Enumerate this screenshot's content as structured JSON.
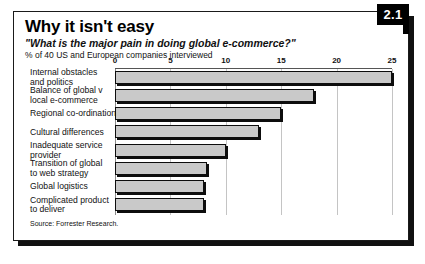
{
  "figure": {
    "badge": "2.1",
    "title": "Why it isn't easy",
    "subtitle": "\"What is the major pain in doing global e-commerce?\"",
    "units": "% of 40 US and European companies interviewed",
    "source": "Source: Forrester Research."
  },
  "chart_data": {
    "type": "bar",
    "orientation": "horizontal",
    "title": "Why it isn't easy",
    "subtitle": "\"What is the major pain in doing global e-commerce?\"",
    "xlabel": "% of 40 US and European companies interviewed",
    "ylabel": "",
    "xlim": [
      0,
      25
    ],
    "xticks": [
      0,
      5,
      10,
      15,
      20,
      25
    ],
    "xtick_labels": [
      "0",
      "5",
      "10",
      "15",
      "20",
      "25"
    ],
    "grid": "vertical",
    "legend": "none",
    "bar_color": "#c9c9c9",
    "bar_edge_color": "#0d0d0d",
    "categories": [
      "Internal obstacles and politics",
      "Balance of global v local e-commerce",
      "Regional co-ordination",
      "Cultural differences",
      "Inadequate service provider",
      "Transition of global to web strategy",
      "Global logistics",
      "Complicated product to deliver"
    ],
    "category_lines": [
      [
        "Internal obstacles",
        "and politics"
      ],
      [
        "Balance of global v",
        "local e-commerce"
      ],
      [
        "Regional co-ordination"
      ],
      [
        "Cultural differences"
      ],
      [
        "Inadequate service",
        "provider"
      ],
      [
        "Transition of global",
        "to web strategy"
      ],
      [
        "Global logistics"
      ],
      [
        "Complicated product",
        "to deliver"
      ]
    ],
    "values": [
      25,
      18,
      15,
      13,
      10,
      8.3,
      8,
      8
    ],
    "source": "Source: Forrester Research."
  }
}
